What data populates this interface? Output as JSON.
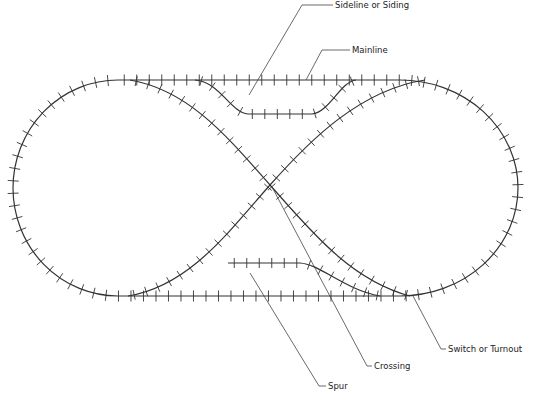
{
  "diagram": {
    "labels": {
      "siding": "Sideline or Siding",
      "mainline": "Mainline",
      "switch": "Switch or Turnout",
      "crossing": "Crossing",
      "spur": "Spur"
    },
    "colors": {
      "track": "#333333",
      "tie": "#333333",
      "leader": "#444444",
      "background": "#ffffff"
    }
  }
}
